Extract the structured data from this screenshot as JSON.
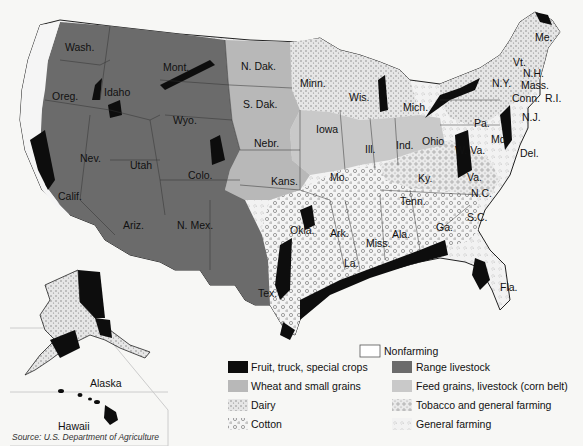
{
  "map": {
    "title": "Agricultural regions of the United States",
    "colors": {
      "fruit_truck_special": "#0d0d0d",
      "range_livestock": "#6b6b6b",
      "wheat_small_grains": "#b8b8b8",
      "feed_grains_corn_belt": "#c9c9c9",
      "nonfarming": "#ffffff",
      "dairy": "#dcdcdc",
      "cotton": "#eeeeee",
      "tobacco_general": "#e2e2e2",
      "general_farming": "#f0f0f0",
      "background": "#f7f7f5"
    },
    "state_labels": [
      {
        "name": "Wash.",
        "x": 65,
        "y": 42
      },
      {
        "name": "Mont.",
        "x": 163,
        "y": 62
      },
      {
        "name": "N. Dak.",
        "x": 241,
        "y": 61
      },
      {
        "name": "Minn.",
        "x": 300,
        "y": 78
      },
      {
        "name": "Wis.",
        "x": 349,
        "y": 92
      },
      {
        "name": "Mich.",
        "x": 403,
        "y": 102
      },
      {
        "name": "Oreg.",
        "x": 52,
        "y": 91
      },
      {
        "name": "Idaho",
        "x": 104,
        "y": 87
      },
      {
        "name": "Wyo.",
        "x": 173,
        "y": 115
      },
      {
        "name": "S. Dak.",
        "x": 243,
        "y": 99
      },
      {
        "name": "Iowa",
        "x": 316,
        "y": 124
      },
      {
        "name": "Nebr.",
        "x": 254,
        "y": 138
      },
      {
        "name": "Ill.",
        "x": 365,
        "y": 144
      },
      {
        "name": "Ind.",
        "x": 396,
        "y": 140
      },
      {
        "name": "Ohio",
        "x": 422,
        "y": 136
      },
      {
        "name": "Nev.",
        "x": 80,
        "y": 153
      },
      {
        "name": "Utah",
        "x": 130,
        "y": 160
      },
      {
        "name": "Colo.",
        "x": 188,
        "y": 170
      },
      {
        "name": "Kans.",
        "x": 271,
        "y": 176
      },
      {
        "name": "Mo.",
        "x": 330,
        "y": 172
      },
      {
        "name": "Ky.",
        "x": 418,
        "y": 173
      },
      {
        "name": "Calif.",
        "x": 58,
        "y": 191
      },
      {
        "name": "Ariz.",
        "x": 123,
        "y": 220
      },
      {
        "name": "N. Mex.",
        "x": 177,
        "y": 220
      },
      {
        "name": "Okla.",
        "x": 290,
        "y": 225
      },
      {
        "name": "Ark.",
        "x": 330,
        "y": 228
      },
      {
        "name": "Miss.",
        "x": 366,
        "y": 238
      },
      {
        "name": "Ala.",
        "x": 392,
        "y": 229
      },
      {
        "name": "Tenn.",
        "x": 400,
        "y": 196
      },
      {
        "name": "Ga.",
        "x": 436,
        "y": 222
      },
      {
        "name": "La.",
        "x": 344,
        "y": 258
      },
      {
        "name": "Tex.",
        "x": 258,
        "y": 288
      },
      {
        "name": "Fla.",
        "x": 500,
        "y": 282
      },
      {
        "name": "Me.",
        "x": 535,
        "y": 32
      },
      {
        "name": "Vt.",
        "x": 513,
        "y": 57
      },
      {
        "name": "N.H.",
        "x": 523,
        "y": 68
      },
      {
        "name": "N.Y.",
        "x": 492,
        "y": 78
      },
      {
        "name": "Mass.",
        "x": 521,
        "y": 80
      },
      {
        "name": "Conn.",
        "x": 512,
        "y": 93
      },
      {
        "name": "R.I.",
        "x": 545,
        "y": 93
      },
      {
        "name": "Pa.",
        "x": 474,
        "y": 118
      },
      {
        "name": "N.J.",
        "x": 522,
        "y": 112
      },
      {
        "name": "Md.",
        "x": 491,
        "y": 134
      },
      {
        "name": "Del.",
        "x": 520,
        "y": 148
      },
      {
        "name": "W. Va.",
        "x": 455,
        "y": 145
      },
      {
        "name": "Va.",
        "x": 467,
        "y": 172
      },
      {
        "name": "N.C.",
        "x": 471,
        "y": 188
      },
      {
        "name": "S.C.",
        "x": 467,
        "y": 212
      }
    ],
    "insets": {
      "alaska": {
        "label": "Alaska"
      },
      "hawaii": {
        "label": "Hawaii"
      }
    }
  },
  "legend": {
    "items": [
      {
        "key": "nonfarming",
        "label": "Nonfarming"
      },
      {
        "key": "fruit_truck_special",
        "label": "Fruit, truck, special crops"
      },
      {
        "key": "range_livestock",
        "label": "Range livestock"
      },
      {
        "key": "wheat_small_grains",
        "label": "Wheat and small grains"
      },
      {
        "key": "feed_grains_corn_belt",
        "label": "Feed grains, livestock (corn belt)"
      },
      {
        "key": "dairy",
        "label": "Dairy"
      },
      {
        "key": "tobacco_general",
        "label": "Tobacco and general farming"
      },
      {
        "key": "cotton",
        "label": "Cotton"
      },
      {
        "key": "general_farming",
        "label": "General farming"
      }
    ]
  },
  "source": "Source: U.S. Department of Agriculture"
}
